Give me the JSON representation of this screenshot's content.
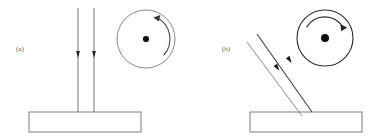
{
  "figure": {
    "caption_style": "two-panel line diagram",
    "background_color": "#ffffff",
    "stroke_color": "#555555",
    "dark_stroke_color": "#1a1a1a",
    "width": 390,
    "height": 140
  },
  "panels": [
    {
      "id": "a",
      "label": "(a)",
      "label_x": 16,
      "label_y": 51,
      "description": "vertical beam pair striking horizontal base with rotating disc",
      "beams": {
        "orientation": "vertical",
        "count": 2,
        "direction": "downward",
        "lines": [
          {
            "x1": 78,
            "y1": 8,
            "x2": 78,
            "y2": 112
          },
          {
            "x1": 94,
            "y1": 8,
            "x2": 94,
            "y2": 112
          }
        ],
        "arrow_markers": [
          {
            "x": 78,
            "y": 56
          },
          {
            "x": 94,
            "y": 56
          }
        ]
      },
      "base": {
        "x": 29,
        "y": 112,
        "width": 112,
        "height": 20
      },
      "disc": {
        "cx": 146,
        "cy": 39,
        "r": 29,
        "hub_r": 3,
        "arc_side": "right",
        "arc_r": 24,
        "arc_start_deg": -62,
        "arc_end_deg": 42,
        "arrow_end": "top"
      }
    },
    {
      "id": "b",
      "label": "(b)",
      "label_x": 222,
      "label_y": 51,
      "description": "tilted beam pair striking horizontal base with rotating disc",
      "beams": {
        "orientation": "diagonal",
        "count": 2,
        "direction": "down-right",
        "angle_deg": 52,
        "lines": [
          {
            "x1": 257,
            "y1": 34,
            "x2": 312,
            "y2": 112
          },
          {
            "x1": 247,
            "y1": 42,
            "x2": 302,
            "y2": 115
          }
        ],
        "arrow_markers": [
          {
            "x": 290,
            "y": 62
          },
          {
            "x": 278,
            "y": 70
          }
        ]
      },
      "base": {
        "x": 250,
        "y": 112,
        "width": 112,
        "height": 20
      },
      "disc": {
        "cx": 325,
        "cy": 38,
        "r": 28,
        "hub_r": 4,
        "arc_side": "top",
        "arc_r": 21,
        "arc_start_deg": -150,
        "arc_end_deg": -28,
        "arrow_end": "right"
      }
    }
  ]
}
